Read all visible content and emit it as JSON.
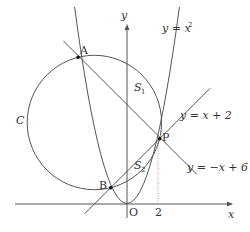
{
  "diagram": {
    "axes": {
      "x_label": "x",
      "y_label": "y",
      "origin_label": "O",
      "tick_label_x": "2"
    },
    "curves": {
      "parabola": "y = x",
      "parabola_exp": "2",
      "line1": "y = x + 2",
      "line2": "y = −x + 6",
      "circle": "C"
    },
    "points": {
      "A": "A",
      "B": "B",
      "P": "P"
    },
    "regions": {
      "S1": "S",
      "S1_sub": "1",
      "S2": "S",
      "S2_sub": "2"
    },
    "colors": {
      "stroke": "#555555",
      "text": "#333333",
      "background": "#ffffff"
    }
  }
}
